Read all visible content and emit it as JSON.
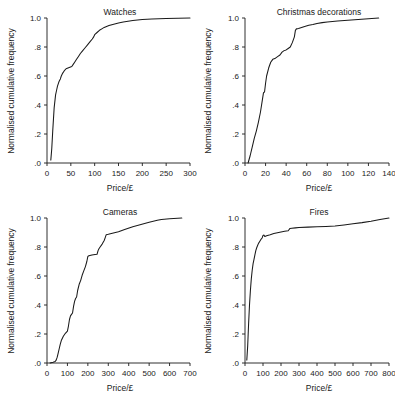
{
  "figure": {
    "background": "#ffffff",
    "line_color": "#1a1a1a",
    "shared_ylabel": "Normalised cumulative frequency",
    "shared_xlabel": "Price/£",
    "y_ticks": [
      ".0",
      ".2",
      ".4",
      ".6",
      ".8",
      "1.0"
    ],
    "y_values": [
      0,
      0.2,
      0.4,
      0.6,
      0.8,
      1.0
    ],
    "ylim": [
      0,
      1.0
    ]
  },
  "chart_data": [
    {
      "id": "watches",
      "type": "line",
      "title": "Watches",
      "xlabel": "Price/£",
      "ylabel": "Normalised cumulative frequency",
      "xlim": [
        0,
        300
      ],
      "ylim": [
        0,
        1.0
      ],
      "x_ticks": [
        0,
        50,
        100,
        150,
        200,
        250,
        300
      ],
      "x_tick_labels": [
        "0",
        "50",
        "100",
        "150",
        "200",
        "250",
        "300"
      ],
      "y_ticks": [
        0,
        0.2,
        0.4,
        0.6,
        0.8,
        1.0
      ],
      "y_tick_labels": [
        ".0",
        ".2",
        ".4",
        ".6",
        ".8",
        "1.0"
      ],
      "grid": false,
      "legend": "none",
      "x": [
        8,
        10,
        12,
        15,
        18,
        20,
        22,
        25,
        28,
        30,
        33,
        36,
        40,
        44,
        48,
        52,
        55,
        58,
        62,
        66,
        70,
        75,
        80,
        85,
        90,
        95,
        98,
        100,
        105,
        110,
        115,
        120,
        125,
        130,
        140,
        150,
        160,
        170,
        180,
        200,
        220,
        250,
        275,
        300
      ],
      "y": [
        0.02,
        0.1,
        0.22,
        0.38,
        0.47,
        0.5,
        0.53,
        0.56,
        0.58,
        0.6,
        0.62,
        0.635,
        0.65,
        0.655,
        0.66,
        0.665,
        0.68,
        0.695,
        0.715,
        0.735,
        0.755,
        0.775,
        0.795,
        0.815,
        0.835,
        0.855,
        0.87,
        0.885,
        0.9,
        0.915,
        0.925,
        0.935,
        0.942,
        0.948,
        0.957,
        0.965,
        0.972,
        0.978,
        0.983,
        0.99,
        0.993,
        0.996,
        0.998,
        1.0
      ]
    },
    {
      "id": "christmas-decorations",
      "type": "line",
      "title": "Christmas decorations",
      "xlabel": "Price/£",
      "ylabel": "Normalised cumulative frequency",
      "xlim": [
        0,
        140
      ],
      "ylim": [
        0,
        1.0
      ],
      "x_ticks": [
        0,
        20,
        40,
        60,
        80,
        100,
        120,
        140
      ],
      "x_tick_labels": [
        "0",
        "20",
        "40",
        "60",
        "80",
        "100",
        "120",
        "140"
      ],
      "y_ticks": [
        0,
        0.2,
        0.4,
        0.6,
        0.8,
        1.0
      ],
      "y_tick_labels": [
        ".0",
        ".2",
        ".4",
        ".6",
        ".8",
        "1.0"
      ],
      "grid": false,
      "legend": "none",
      "x": [
        3,
        5,
        7,
        9,
        11,
        13,
        15,
        17,
        18,
        19,
        20,
        21,
        23,
        25,
        27,
        29,
        30,
        32,
        34,
        36,
        38,
        40,
        42,
        44,
        46,
        48,
        49,
        50,
        52,
        55,
        58,
        62,
        66,
        70,
        75,
        80,
        90,
        100,
        110,
        120,
        130
      ],
      "y": [
        0.0,
        0.05,
        0.11,
        0.17,
        0.22,
        0.28,
        0.35,
        0.44,
        0.485,
        0.49,
        0.55,
        0.6,
        0.655,
        0.695,
        0.715,
        0.72,
        0.725,
        0.735,
        0.745,
        0.765,
        0.775,
        0.78,
        0.79,
        0.8,
        0.83,
        0.87,
        0.915,
        0.925,
        0.928,
        0.935,
        0.942,
        0.95,
        0.955,
        0.962,
        0.968,
        0.973,
        0.98,
        0.985,
        0.99,
        0.995,
        1.0
      ]
    },
    {
      "id": "cameras",
      "type": "line",
      "title": "Cameras",
      "xlabel": "Price/£",
      "ylabel": "Normalised cumulative frequency",
      "xlim": [
        0,
        700
      ],
      "ylim": [
        0,
        1.0
      ],
      "x_ticks": [
        0,
        100,
        200,
        300,
        400,
        500,
        600,
        700
      ],
      "x_tick_labels": [
        "0",
        "100",
        "200",
        "300",
        "400",
        "500",
        "600",
        "700"
      ],
      "y_ticks": [
        0,
        0.2,
        0.4,
        0.6,
        0.8,
        1.0
      ],
      "y_tick_labels": [
        ".0",
        ".2",
        ".4",
        ".6",
        ".8",
        "1.0"
      ],
      "grid": false,
      "legend": "none",
      "x": [
        15,
        30,
        40,
        45,
        50,
        55,
        60,
        65,
        70,
        80,
        90,
        100,
        105,
        110,
        115,
        120,
        125,
        130,
        135,
        140,
        145,
        150,
        158,
        165,
        172,
        180,
        188,
        195,
        200,
        205,
        210,
        220,
        235,
        245,
        250,
        255,
        260,
        270,
        280,
        285,
        290,
        300,
        320,
        350,
        380,
        420,
        460,
        500,
        540,
        560,
        600,
        660
      ],
      "y": [
        0.0,
        0.005,
        0.01,
        0.02,
        0.04,
        0.07,
        0.1,
        0.13,
        0.155,
        0.185,
        0.205,
        0.22,
        0.255,
        0.3,
        0.325,
        0.335,
        0.345,
        0.39,
        0.425,
        0.445,
        0.455,
        0.5,
        0.545,
        0.57,
        0.605,
        0.635,
        0.665,
        0.7,
        0.735,
        0.74,
        0.742,
        0.745,
        0.748,
        0.75,
        0.775,
        0.79,
        0.8,
        0.82,
        0.845,
        0.865,
        0.885,
        0.888,
        0.895,
        0.905,
        0.92,
        0.94,
        0.955,
        0.97,
        0.985,
        0.99,
        0.995,
        1.0
      ]
    },
    {
      "id": "fires",
      "type": "line",
      "title": "Fires",
      "xlabel": "Price/£",
      "ylabel": "Normalised cumulative frequency",
      "xlim": [
        0,
        800
      ],
      "ylim": [
        0,
        1.0
      ],
      "x_ticks": [
        0,
        100,
        200,
        300,
        400,
        500,
        600,
        700,
        800
      ],
      "x_tick_labels": [
        "0",
        "100",
        "200",
        "300",
        "400",
        "500",
        "600",
        "700",
        "800"
      ],
      "y_ticks": [
        0,
        0.2,
        0.4,
        0.6,
        0.8,
        1.0
      ],
      "y_tick_labels": [
        ".0",
        ".2",
        ".4",
        ".6",
        ".8",
        "1.0"
      ],
      "grid": false,
      "legend": "none",
      "x": [
        10,
        15,
        20,
        25,
        30,
        35,
        40,
        45,
        50,
        55,
        60,
        65,
        70,
        75,
        80,
        90,
        95,
        100,
        105,
        110,
        120,
        140,
        160,
        180,
        200,
        220,
        240,
        250,
        260,
        280,
        300,
        350,
        400,
        450,
        500,
        550,
        600,
        650,
        700,
        750,
        800
      ],
      "y": [
        0.02,
        0.12,
        0.27,
        0.4,
        0.5,
        0.58,
        0.64,
        0.685,
        0.715,
        0.745,
        0.775,
        0.795,
        0.81,
        0.825,
        0.835,
        0.855,
        0.862,
        0.88,
        0.882,
        0.872,
        0.878,
        0.885,
        0.893,
        0.898,
        0.903,
        0.908,
        0.912,
        0.928,
        0.93,
        0.932,
        0.934,
        0.937,
        0.94,
        0.942,
        0.945,
        0.952,
        0.96,
        0.968,
        0.978,
        0.99,
        1.0
      ]
    }
  ]
}
